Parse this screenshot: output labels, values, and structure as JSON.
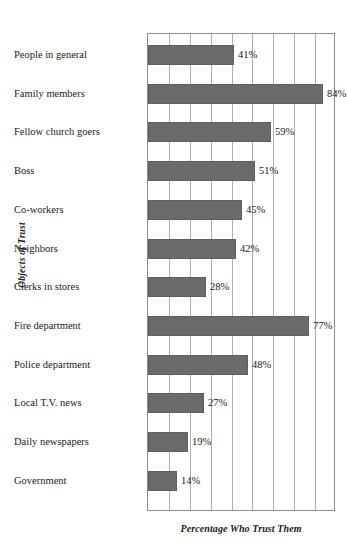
{
  "chart_data": {
    "type": "bar",
    "orientation": "horizontal",
    "title": "",
    "xlabel": "Percentage Who Trust Them",
    "ylabel": "Objects of Trust",
    "xlim": [
      0,
      90
    ],
    "grid": true,
    "gridline_step": 10,
    "legend": "none",
    "bar_color": "#6b6b6b",
    "categories": [
      "People in general",
      "Family members",
      "Fellow church goers",
      "Boss",
      "Co-workers",
      "Neighbors",
      "Clerks in stores",
      "Fire department",
      "Police department",
      "Local T.V. news",
      "Daily newspapers",
      "Government"
    ],
    "values": [
      41,
      84,
      59,
      51,
      45,
      42,
      28,
      77,
      48,
      27,
      19,
      14
    ],
    "value_labels": [
      "41%",
      "84%",
      "59%",
      "51%",
      "45%",
      "42%",
      "28%",
      "77%",
      "48%",
      "27%",
      "19%",
      "14%"
    ]
  }
}
